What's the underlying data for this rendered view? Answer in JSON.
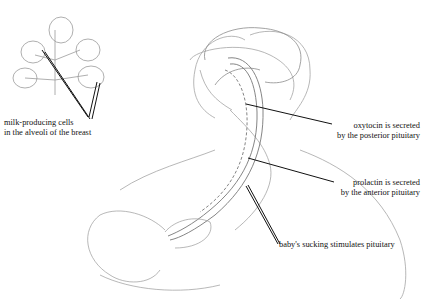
{
  "diagram": {
    "colors": {
      "sketch": "#9a9a9a",
      "leader": "#111111",
      "background": "#ffffff"
    },
    "labels": {
      "alveoli": {
        "line1": "milk-producing cells",
        "line2": "in the alveoli of the breast"
      },
      "oxytocin": {
        "line1": "oxytocin is secreted",
        "line2": "by the posterior pituitary"
      },
      "prolactin": {
        "line1": "prolactin is secreted",
        "line2": "by the anterior pituitary"
      },
      "sucking": {
        "line1": "baby's sucking stimulates pituitary"
      }
    }
  }
}
